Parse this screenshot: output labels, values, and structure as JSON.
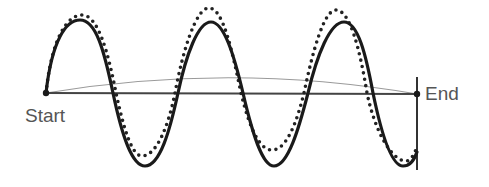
{
  "diagram": {
    "labels": {
      "start": "Start",
      "end": "End"
    },
    "colors": {
      "solid_wave": "#1a1a1a",
      "dotted_wave": "#222222",
      "baseline": "#444444",
      "arc": "#9a9a9a",
      "end_marker": "#333333",
      "label_text": "#555555"
    },
    "points": {
      "start": [
        46,
        93
      ],
      "end": [
        417,
        94
      ]
    },
    "baseline": {
      "x1": 46,
      "y1": 93,
      "x2": 417,
      "y2": 94
    },
    "end_marker_line": {
      "x": 417,
      "y1": 77,
      "y2": 170
    },
    "arc": "M46,93 Q231,62 417,94",
    "solid_wave": "M46,93 C52,40 66,20 80,20 C96,20 104,50 113,93 C122,136 132,166 145,166 C160,166 170,130 178,93 C186,55 198,22 211,22 C224,22 234,55 243,93 C252,132 262,166 274,166 C288,166 299,128 308,93 C317,55 330,22 344,22 C358,22 366,55 373,93 C381,132 391,166 403,166 C411,166 415,158 417,152",
    "dotted_wave": "M46,93 C52,36 68,15 82,15 C98,15 108,52 116,93 C124,130 132,156 142,156 C156,156 168,128 175,93 C183,50 196,8 209,8 C223,8 232,50 241,93 C250,130 260,150 272,150 C286,150 296,125 304,93 C313,50 324,10 336,10 C350,10 360,50 367,93 C375,132 392,161 406,161 C412,161 416,150 417,146"
  }
}
